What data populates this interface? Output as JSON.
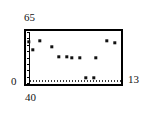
{
  "chart_data": {
    "type": "scatter",
    "title": "",
    "xlabel": "",
    "ylabel": "",
    "xlim": [
      40,
      13
    ],
    "ylim": [
      0,
      65
    ],
    "x_tick_labels": [
      "40",
      "13"
    ],
    "y_tick_labels": [
      "0",
      "65"
    ],
    "grid": false,
    "legend": null,
    "marker_style": "filled-square",
    "marker_color": "#111111",
    "frame_color": "#000000",
    "background_color": "#ffffff",
    "x_axis_reversed": true,
    "points": [
      {
        "px": 29,
        "py": 42,
        "x": 39.3,
        "y": 54.8
      },
      {
        "px": 40,
        "py": 41,
        "x": 36.0,
        "y": 56.1
      },
      {
        "px": 33,
        "py": 50,
        "x": 38.1,
        "y": 44.6
      },
      {
        "px": 52,
        "py": 47,
        "x": 32.4,
        "y": 48.4
      },
      {
        "px": 59,
        "py": 57,
        "x": 30.3,
        "y": 35.7
      },
      {
        "px": 67,
        "py": 57,
        "x": 27.9,
        "y": 35.7
      },
      {
        "px": 72,
        "py": 58,
        "x": 26.4,
        "y": 34.4
      },
      {
        "px": 80,
        "py": 58,
        "x": 24.0,
        "y": 34.4
      },
      {
        "px": 96,
        "py": 58,
        "x": 19.2,
        "y": 34.4
      },
      {
        "px": 107,
        "py": 41,
        "x": 15.9,
        "y": 56.1
      },
      {
        "px": 115,
        "py": 43,
        "x": 13.5,
        "y": 53.6
      },
      {
        "px": 86,
        "py": 78,
        "x": 22.2,
        "y": 8.9
      },
      {
        "px": 94,
        "py": 78,
        "x": 19.8,
        "y": 8.9
      }
    ]
  },
  "labels": {
    "y_max": "65",
    "y_min": "0",
    "x_min": "40",
    "x_max": "13"
  }
}
